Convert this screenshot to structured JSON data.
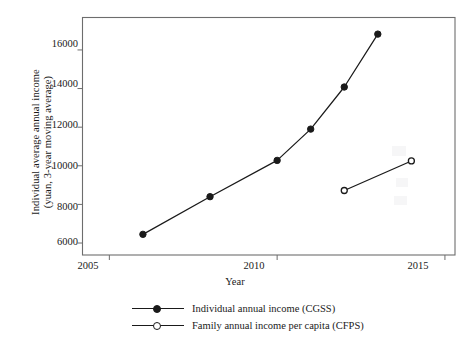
{
  "chart_data": {
    "type": "line",
    "title": "",
    "xlabel": "Year",
    "ylabel": "Individual average annual income (yuan, 3-year moving average)",
    "ylabel_line1": "Individual average annual income",
    "ylabel_line2": "(yuan, 3-year moving average)",
    "xlim": [
      2004.2,
      2015.3
    ],
    "ylim": [
      5380,
      17680
    ],
    "xticks": [
      2005,
      2010,
      2015
    ],
    "xtick_labels": [
      "2005",
      "2010",
      "2015"
    ],
    "yticks": [
      6000,
      8000,
      10000,
      12000,
      14000,
      16000
    ],
    "ytick_labels": [
      "6000",
      "8000",
      "10000",
      "12000",
      "14000",
      "16000"
    ],
    "grid": false,
    "legend_position": "below-center",
    "series": [
      {
        "name": "Individual annual income (CGSS)",
        "marker": "filled-circle",
        "color": "#1a1a1a",
        "x": [
          2006,
          2008,
          2010,
          2011,
          2012,
          2013
        ],
        "values": [
          6450,
          8400,
          10280,
          11900,
          14080,
          16820
        ]
      },
      {
        "name": "Family annual income per capita (CFPS)",
        "marker": "open-circle",
        "color": "#1a1a1a",
        "x": [
          2012,
          2014
        ],
        "values": [
          8720,
          10250
        ]
      }
    ]
  },
  "legend": {
    "entries": [
      {
        "label": "Individual annual income (CGSS)",
        "marker": "filled-circle"
      },
      {
        "label": "Family annual income per capita (CFPS)",
        "marker": "open-circle"
      }
    ]
  },
  "axes": {
    "x_title": "Year",
    "y_title_line1": "Individual average annual income",
    "y_title_line2": "(yuan, 3-year moving average)"
  },
  "colors": {
    "line": "#1a1a1a",
    "frame": "#6d6d6d",
    "background": "#ffffff"
  }
}
